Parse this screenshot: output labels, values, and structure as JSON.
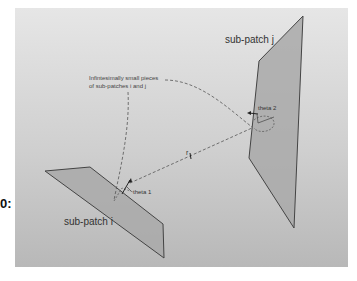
{
  "figure": {
    "side_label": "0:",
    "background": {
      "top_color": "#e6e6e6",
      "bottom_color": "#b8b8b8"
    },
    "patch_fill": "#a9a9a9",
    "patch_stroke": "#444444"
  },
  "labels": {
    "sub_patch_j": "sub-patch j",
    "sub_patch_i": "sub-patch i",
    "annotation_line1": "Infintesimally small pieces",
    "annotation_line2": "of sub-patches i and j",
    "theta1": "theta 1",
    "theta2": "theta 2",
    "distance": "r"
  }
}
